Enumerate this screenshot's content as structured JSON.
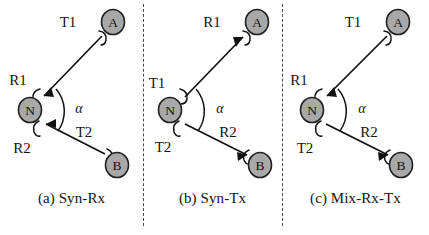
{
  "figure": {
    "background_color": "#ffffff",
    "node_fill_color": "#a8a8a8",
    "node_stroke_color": "#202020",
    "line_color": "#111111",
    "divider_color": "#4a4a4a",
    "angle_symbol": "α",
    "width": 429,
    "height": 235
  },
  "panels": [
    {
      "id": "a",
      "caption": "(a) Syn-Rx",
      "nodes": [
        {
          "id": "A",
          "label": "A",
          "x": 113,
          "y": 22
        },
        {
          "id": "N",
          "label": "N",
          "x": 30,
          "y": 110
        },
        {
          "id": "B",
          "label": "B",
          "x": 117,
          "y": 165
        }
      ],
      "links": [
        {
          "id": "link-top",
          "from": "A",
          "to": "N",
          "direction": "A-to-N",
          "end_label": "T1",
          "start_label": "R1",
          "end_label_pos": {
            "x": 68,
            "y": 27
          },
          "start_label_pos": {
            "x": 18,
            "y": 85
          }
        },
        {
          "id": "link-bottom",
          "from": "B",
          "to": "N",
          "direction": "B-to-N",
          "end_label": "T2",
          "start_label": "R2",
          "end_label_pos": {
            "x": 84,
            "y": 137
          },
          "start_label_pos": {
            "x": 22,
            "y": 153
          }
        }
      ],
      "angle_label": "α",
      "angle_label_pos": {
        "x": 79,
        "y": 113
      }
    },
    {
      "id": "b",
      "caption": "(b) Syn-Tx",
      "nodes": [
        {
          "id": "A",
          "label": "A",
          "x": 114,
          "y": 22
        },
        {
          "id": "N",
          "label": "N",
          "x": 27,
          "y": 110
        },
        {
          "id": "B",
          "label": "B",
          "x": 117,
          "y": 165
        }
      ],
      "links": [
        {
          "id": "link-top",
          "from": "N",
          "to": "A",
          "direction": "N-to-A",
          "end_label": "R1",
          "start_label": "T1",
          "end_label_pos": {
            "x": 69,
            "y": 27
          },
          "start_label_pos": {
            "x": 14,
            "y": 88
          }
        },
        {
          "id": "link-bottom",
          "from": "N",
          "to": "B",
          "direction": "N-to-B",
          "end_label": "R2",
          "start_label": "T2",
          "end_label_pos": {
            "x": 85,
            "y": 137
          },
          "start_label_pos": {
            "x": 20,
            "y": 152
          }
        }
      ],
      "angle_label": "α",
      "angle_label_pos": {
        "x": 77,
        "y": 113
      }
    },
    {
      "id": "c",
      "caption": "(c) Mix-Rx-Tx",
      "nodes": [
        {
          "id": "A",
          "label": "A",
          "x": 116,
          "y": 22
        },
        {
          "id": "N",
          "label": "N",
          "x": 30,
          "y": 110
        },
        {
          "id": "B",
          "label": "B",
          "x": 119,
          "y": 165
        }
      ],
      "links": [
        {
          "id": "link-top",
          "from": "A",
          "to": "N",
          "direction": "A-to-N",
          "end_label": "T1",
          "start_label": "R1",
          "end_label_pos": {
            "x": 71,
            "y": 27
          },
          "start_label_pos": {
            "x": 17,
            "y": 85
          }
        },
        {
          "id": "link-bottom",
          "from": "N",
          "to": "B",
          "direction": "N-to-B",
          "end_label": "R2",
          "start_label": "T2",
          "end_label_pos": {
            "x": 87,
            "y": 137
          },
          "start_label_pos": {
            "x": 23,
            "y": 153
          }
        }
      ],
      "angle_label": "α",
      "angle_label_pos": {
        "x": 80,
        "y": 113
      }
    }
  ]
}
